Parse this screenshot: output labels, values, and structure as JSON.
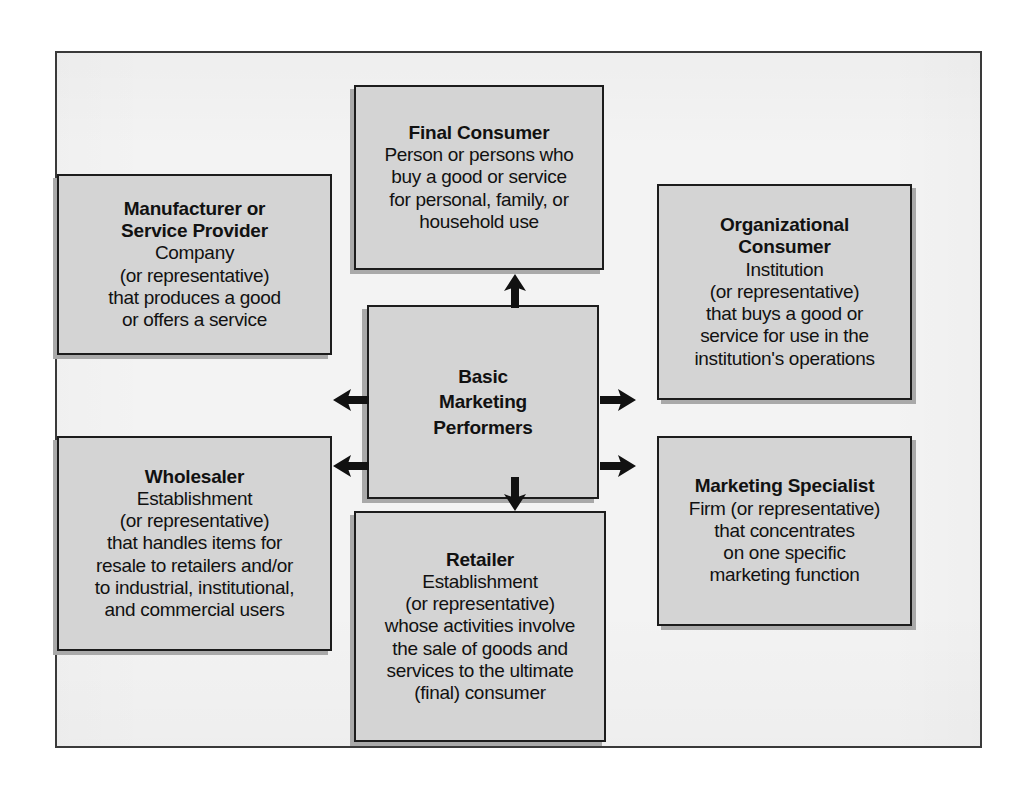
{
  "diagram": {
    "title": "Basic Marketing Performers",
    "center": {
      "label": "Basic\nMarketing\nPerformers"
    },
    "nodes": [
      {
        "id": "final-consumer",
        "title": "Final Consumer",
        "body": "Person or persons who\nbuy a good or service\nfor personal, family, or\nhousehold use"
      },
      {
        "id": "manufacturer-or-service-provider",
        "title": "Manufacturer or\nService Provider",
        "body": "Company\n(or representative)\nthat produces a good\nor offers a service"
      },
      {
        "id": "organizational-consumer",
        "title": "Organizational\nConsumer",
        "body": "Institution\n(or representative)\nthat buys a good or\nservice for use in the\ninstitution's operations"
      },
      {
        "id": "wholesaler",
        "title": "Wholesaler",
        "body": "Establishment\n(or representative)\nthat handles items for\nresale to retailers and/or\nto industrial, institutional,\nand commercial users"
      },
      {
        "id": "retailer",
        "title": "Retailer",
        "body": "Establishment\n(or representative)\nwhose activities involve\nthe sale of goods and\nservices to the ultimate\n(final) consumer"
      },
      {
        "id": "marketing-specialist",
        "title": "Marketing Specialist",
        "body": "Firm (or representative)\nthat concentrates\non one specific\nmarketing function"
      }
    ],
    "arrows": [
      {
        "id": "arrow-up-to-final-consumer",
        "direction": "up"
      },
      {
        "id": "arrow-left-to-manufacturer",
        "direction": "left"
      },
      {
        "id": "arrow-right-to-organizational-consumer",
        "direction": "right"
      },
      {
        "id": "arrow-left-to-wholesaler",
        "direction": "left"
      },
      {
        "id": "arrow-right-to-marketing-specialist",
        "direction": "right"
      },
      {
        "id": "arrow-down-to-retailer",
        "direction": "down"
      }
    ],
    "colors": {
      "box_fill": "#d4d4d4",
      "box_border": "#1c1c1c",
      "shadow": "#a9a9a9",
      "frame_bg": "#f3f3f3",
      "frame_border": "#3a3a3a",
      "text": "#111111",
      "arrow": "#111111"
    }
  }
}
